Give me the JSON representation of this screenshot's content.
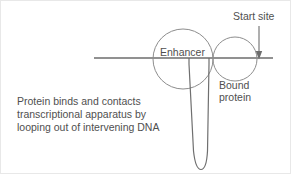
{
  "figure": {
    "background_color": "#ffffff",
    "border_color": "#e8e8e8",
    "stroke_color": "#6d6d6d",
    "circle_stroke_color": "#8d8d8d",
    "text_color": "#4f4f4f"
  },
  "labels": {
    "start_site": "Start site",
    "enhancer": "Enhancer",
    "bound_protein_line1": "Bound",
    "bound_protein_line2": "protein"
  },
  "caption": {
    "line1": "Protein binds and contacts",
    "line2": "transcriptional apparatus by",
    "line3": "looping out of intervening DNA"
  },
  "geometry": {
    "dna_line": {
      "x1": 93,
      "y1": 57,
      "x2": 272,
      "y2": 57
    },
    "enhancer_circle": {
      "cx": 182,
      "cy": 58,
      "r": 30
    },
    "bound_protein_circle": {
      "cx": 234,
      "cy": 58,
      "r": 22
    },
    "start_site_arrow": {
      "x": 258,
      "y_top": 25,
      "y_bottom": 57
    },
    "loop": {
      "left_x": 188,
      "right_x": 207,
      "top_y": 57,
      "bottom_y": 168
    }
  },
  "icons": {
    "down_arrow": "start-site-arrow-icon"
  }
}
